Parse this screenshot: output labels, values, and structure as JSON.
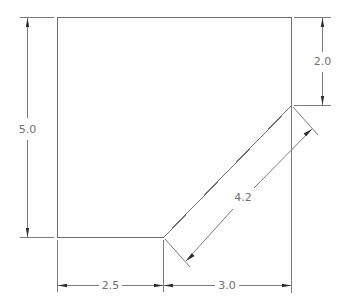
{
  "figure": {
    "type": "technical-drawing",
    "units_shown": false,
    "colors": {
      "background": "#ffffff",
      "outline": "#6f6f6f",
      "dimension_line": "#7a7a7a",
      "arrowhead": "#2a2a2a",
      "text": "#707070"
    }
  },
  "dimensions": {
    "height_left": {
      "label": "5.0",
      "orientation": "vertical",
      "side": "left"
    },
    "notch_right": {
      "label": "2.0",
      "orientation": "vertical",
      "side": "right"
    },
    "chamfer": {
      "label": "4.2",
      "orientation": "aligned",
      "side": "diagonal"
    },
    "bottom_left": {
      "label": "2.5",
      "orientation": "horizontal",
      "side": "bottom"
    },
    "bottom_right": {
      "label": "3.0",
      "orientation": "horizontal",
      "side": "bottom"
    }
  }
}
